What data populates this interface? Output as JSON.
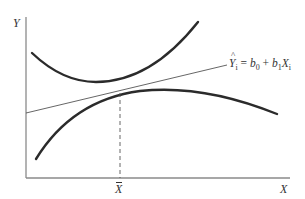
{
  "diagram": {
    "title": "",
    "axes": {
      "y_label": "Y",
      "x_label": "X",
      "x_mean_label": "X",
      "x_mean_has_bar": true
    },
    "regression_equation": {
      "lhs": "Y",
      "lhs_subscript": "i",
      "lhs_hat": "^",
      "equals": " = ",
      "b0": "b",
      "b0_subscript": "0",
      "plus": " + ",
      "b1": "b",
      "b1_subscript": "1",
      "x": "X",
      "x_subscript": "i",
      "full_text": "Ŷi = b0 + b1Xi"
    },
    "elements": [
      {
        "id": "upper-confidence-curve",
        "type": "curve",
        "description": "Upper band curve, U-shaped, minimum left of X-bar"
      },
      {
        "id": "regression-line",
        "type": "line",
        "description": "Fitted regression line Ŷi = b0 + b1Xi"
      },
      {
        "id": "lower-confidence-curve",
        "type": "curve",
        "description": "Lower band curve, inverted-U, maximum right of X-bar"
      },
      {
        "id": "mean-x-dashed-line",
        "type": "dashed-line",
        "description": "Vertical dashed line at X-bar"
      }
    ],
    "colors": {
      "curve": "#2b2b2b",
      "axis": "#8a8a8a",
      "regression_line": "#555555",
      "text": "#333333",
      "background": "#ffffff"
    }
  }
}
